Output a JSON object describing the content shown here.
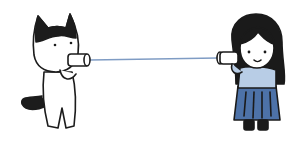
{
  "illustration": {
    "description": "Cat and girl talking through a tin-can string telephone",
    "characters": [
      {
        "name": "cat",
        "colors": {
          "fur": "#ffffff",
          "patch": "#1c1c1c",
          "outline": "#1c1c1c"
        }
      },
      {
        "name": "girl",
        "colors": {
          "hair": "#1a1a1a",
          "skin": "#ffffff",
          "top": "#b8cde6",
          "skirt": "#4d72a8",
          "shoes": "#1a1a1a"
        }
      }
    ],
    "string_color": "#7f9cc4",
    "background": "#ffffff"
  }
}
